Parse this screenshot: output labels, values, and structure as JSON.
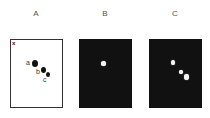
{
  "panels": [
    {
      "id": "A",
      "label": "A",
      "background": "#ffffff",
      "corner_mark": "x",
      "spots": [
        {
          "label": "a",
          "x": 24,
          "y": 23,
          "size": 6
        },
        {
          "label": "b",
          "x": 32,
          "y": 30,
          "size": 5
        },
        {
          "label": "c",
          "x": 37,
          "y": 34,
          "size": 4
        }
      ]
    },
    {
      "id": "B",
      "label": "B",
      "background": "#111111",
      "spots": [
        {
          "x": 24,
          "y": 24,
          "size": 4
        }
      ]
    },
    {
      "id": "C",
      "label": "C",
      "background": "#111111",
      "spots": [
        {
          "x": 24,
          "y": 23,
          "size": 4
        },
        {
          "x": 32,
          "y": 33,
          "size": 4
        },
        {
          "x": 37,
          "y": 38,
          "size": 5
        }
      ]
    }
  ],
  "labels": {
    "a": "A",
    "b": "B",
    "c": "C",
    "x": "x",
    "spot_a": "a",
    "spot_b": "b",
    "spot_c": "c"
  }
}
